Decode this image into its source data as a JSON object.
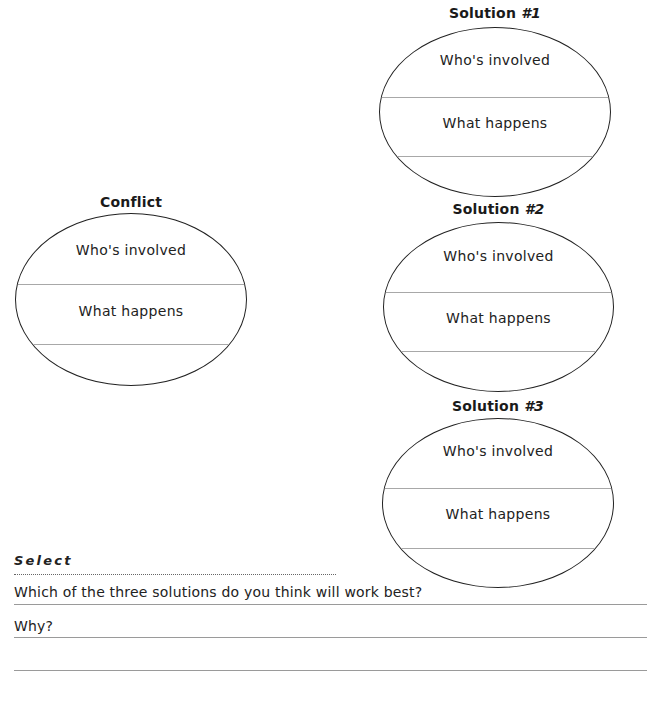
{
  "worksheet": {
    "conflict": {
      "title": "Conflict",
      "prompts": [
        "Who's involved",
        "What happens"
      ]
    },
    "solutions": [
      {
        "title": "Solution",
        "number": "#1",
        "prompts": [
          "Who's involved",
          "What happens"
        ]
      },
      {
        "title": "Solution",
        "number": "#2",
        "prompts": [
          "Who's involved",
          "What happens"
        ]
      },
      {
        "title": "Solution",
        "number": "#3",
        "prompts": [
          "Who's involved",
          "What happens"
        ]
      }
    ],
    "select": {
      "heading": "Select",
      "question": "Which of the three solutions do you think will work best?",
      "why": "Why?",
      "answer_value": "",
      "why_value": "",
      "why_continued_value": ""
    }
  },
  "colors": {
    "ink": "#222222",
    "rule": "#9a9a9a",
    "background": "#ffffff"
  }
}
